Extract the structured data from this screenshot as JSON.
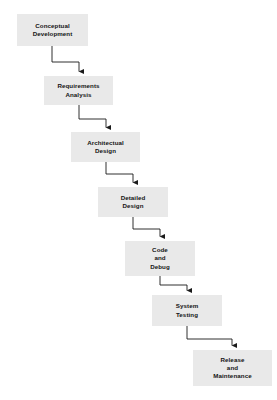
{
  "diagram": {
    "background_color": "#ffffff",
    "box_fill_color": "#e9e9e9",
    "text_color": "#141414",
    "connector_color": "#1a1a1a",
    "caption": "",
    "stages": [
      {
        "id": "conceptual-development",
        "label": "Conceptual\nDevelopment",
        "order": 1,
        "x": 17,
        "y": 14,
        "width": 71,
        "height": 32
      },
      {
        "id": "requirements-analysis",
        "label": "Requirements\nAnalysis",
        "order": 2,
        "x": 44,
        "y": 76,
        "width": 69,
        "height": 29
      },
      {
        "id": "architectual-design",
        "label": "Architectual\nDesign",
        "order": 3,
        "x": 71,
        "y": 132,
        "width": 69,
        "height": 30
      },
      {
        "id": "detailed-design",
        "label": "Detailed\nDesign",
        "order": 4,
        "x": 98,
        "y": 187,
        "width": 70,
        "height": 30
      },
      {
        "id": "code-and-debug",
        "label": "Code\nand\nDebug",
        "order": 5,
        "x": 125,
        "y": 241,
        "width": 70,
        "height": 35
      },
      {
        "id": "system-testing",
        "label": "System\nTesting",
        "order": 6,
        "x": 152,
        "y": 295,
        "width": 70,
        "height": 31
      },
      {
        "id": "release-and-maintenance",
        "label": "Release\nand\nMaintenance",
        "order": 7,
        "x": 193,
        "y": 350,
        "width": 79,
        "height": 36
      }
    ],
    "connectors": [
      {
        "id": "conn-1",
        "from": "conceptual-development",
        "to": "requirements-analysis",
        "start_x": 52,
        "start_y": 46,
        "corner_x": 79,
        "corner_y": 62,
        "end_x": 79,
        "end_y": 75
      },
      {
        "id": "conn-2",
        "from": "requirements-analysis",
        "to": "architectual-design",
        "start_x": 79,
        "start_y": 105,
        "corner_x": 106,
        "corner_y": 119,
        "end_x": 106,
        "end_y": 131
      },
      {
        "id": "conn-3",
        "from": "architectual-design",
        "to": "detailed-design",
        "start_x": 106,
        "start_y": 162,
        "corner_x": 133,
        "corner_y": 174,
        "end_x": 133,
        "end_y": 186
      },
      {
        "id": "conn-4",
        "from": "detailed-design",
        "to": "code-and-debug",
        "start_x": 133,
        "start_y": 217,
        "corner_x": 160,
        "corner_y": 229,
        "end_x": 160,
        "end_y": 240
      },
      {
        "id": "conn-5",
        "from": "code-and-debug",
        "to": "system-testing",
        "start_x": 160,
        "start_y": 276,
        "corner_x": 187,
        "corner_y": 285,
        "end_x": 187,
        "end_y": 294
      },
      {
        "id": "conn-6",
        "from": "system-testing",
        "to": "release-and-maintenance",
        "start_x": 187,
        "start_y": 326,
        "corner_x": 232,
        "corner_y": 339,
        "end_x": 232,
        "end_y": 349
      }
    ]
  }
}
